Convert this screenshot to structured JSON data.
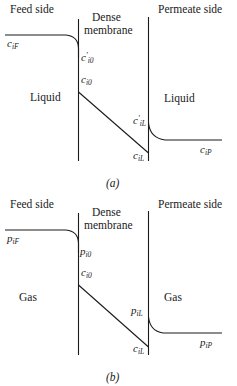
{
  "diagram": {
    "type": "membrane concentration profile",
    "panels": [
      {
        "id": "a",
        "caption": "(a)",
        "headers": {
          "feed": "Feed side",
          "membrane_line1": "Dense",
          "membrane_line2": "membrane",
          "permeate": "Permeate side"
        },
        "phase_feed": "Liquid",
        "phase_permeate": "Liquid",
        "labels": {
          "feed_bulk": {
            "base": "c",
            "sub": "iF",
            "sup": ""
          },
          "feed_interface": {
            "base": "c",
            "sub": "i0",
            "sup": "′"
          },
          "membrane_feed_face": {
            "base": "c",
            "sub": "i0",
            "sup": ""
          },
          "permeate_interface": {
            "base": "c",
            "sub": "iL",
            "sup": "′"
          },
          "membrane_permeate_face": {
            "base": "c",
            "sub": "iL",
            "sup": ""
          },
          "permeate_bulk": {
            "base": "c",
            "sub": "iP",
            "sup": ""
          }
        }
      },
      {
        "id": "b",
        "caption": "(b)",
        "headers": {
          "feed": "Feed side",
          "membrane_line1": "Dense",
          "membrane_line2": "membrane",
          "permeate": "Permeate side"
        },
        "phase_feed": "Gas",
        "phase_permeate": "Gas",
        "labels": {
          "feed_bulk": {
            "base": "p",
            "sub": "iF",
            "sup": ""
          },
          "feed_interface": {
            "base": "p",
            "sub": "i0",
            "sup": ""
          },
          "membrane_feed_face": {
            "base": "c",
            "sub": "i0",
            "sup": ""
          },
          "permeate_interface": {
            "base": "p",
            "sub": "iL",
            "sup": ""
          },
          "membrane_permeate_face": {
            "base": "c",
            "sub": "iL",
            "sup": ""
          },
          "permeate_bulk": {
            "base": "p",
            "sub": "iP",
            "sup": ""
          }
        }
      }
    ],
    "colors": {
      "line": "#1a1a1a",
      "text": "#1a1a1a",
      "background": "#ffffff"
    }
  }
}
